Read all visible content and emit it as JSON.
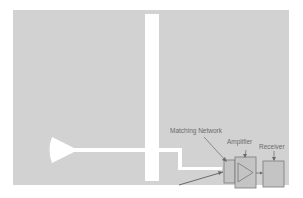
{
  "diagram": {
    "type": "antenna-receiver-schematic",
    "colors": {
      "background": "#ffffff",
      "ground_plane": "#d2d2d2",
      "conductor": "#ffffff",
      "block_fill": "#c4c4c4",
      "block_stroke": "#7a7a7a",
      "arrow": "#6a6a6a",
      "label": "#6b6b6b"
    },
    "labels": {
      "matching_network": "Matching Network",
      "amplifier": "Amplifier",
      "receiver": "Receiver"
    },
    "blocks": [
      {
        "id": "matching-network",
        "label": "Matching Network"
      },
      {
        "id": "amplifier",
        "label": "Amplifier",
        "symbol": "triangle"
      },
      {
        "id": "receiver",
        "label": "Receiver"
      }
    ],
    "connections": [
      {
        "from": "matching-network",
        "to": "amplifier"
      },
      {
        "from": "amplifier",
        "to": "receiver"
      }
    ]
  }
}
